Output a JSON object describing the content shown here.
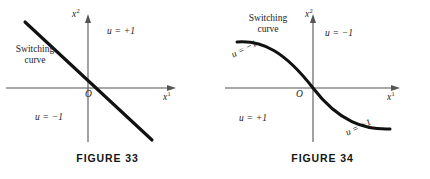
{
  "figures": [
    {
      "id": "figure-33",
      "caption": "FIGURE 33",
      "axes": {
        "x_label": "x",
        "x_superscript": "1",
        "y_label": "x",
        "y_superscript": "2",
        "origin_label": "O"
      },
      "switching_curve_label": {
        "line1": "Switching",
        "line2": "curve"
      },
      "regions": [
        {
          "name": "upper-right-region",
          "label": "u = +1"
        },
        {
          "name": "lower-left-region",
          "label": "u = −1"
        }
      ],
      "curve": {
        "type": "straight-line",
        "description": "negative-slope switching line through origin"
      }
    },
    {
      "id": "figure-34",
      "caption": "FIGURE 34",
      "axes": {
        "x_label": "x",
        "x_superscript": "1",
        "y_label": "x",
        "y_superscript": "2",
        "origin_label": "O"
      },
      "switching_curve_label": {
        "line1": "Switching",
        "line2": "curve"
      },
      "regions": [
        {
          "name": "upper-right-region",
          "label": "u = −1"
        },
        {
          "name": "lower-left-region",
          "label": "u = +1"
        }
      ],
      "curve_branch_labels": [
        {
          "name": "upper-branch",
          "label": "u = −1"
        },
        {
          "name": "lower-branch",
          "label": "u = +1"
        }
      ],
      "curve": {
        "type": "s-curve",
        "description": "monotone decreasing sigmoid switching curve through origin"
      }
    }
  ],
  "style": {
    "ink": "#1a1a1a",
    "axis": "#4d4d4d",
    "background": "#ffffff"
  }
}
